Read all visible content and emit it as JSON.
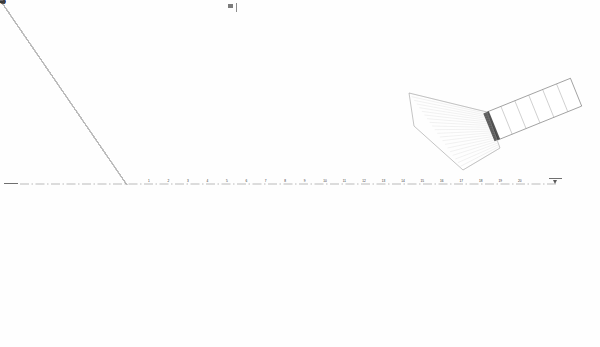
{
  "drawing": {
    "type": "architectural-floor-plan",
    "subject": "pointed-oval auditorium / arena seating plan",
    "background_color": "#ffffff",
    "ink_color": "#2b2b2b",
    "faint_ink_color": "#b9b9b9",
    "column_color": "#1d1d1d",
    "annotation_color": "#4a4a4a",
    "canvas": {
      "width": 600,
      "height": 347
    }
  },
  "markers": {
    "top_marker_label": "",
    "left_axis_marker_label": "",
    "right_axis_marker_label": ""
  },
  "geometry": {
    "focal_point": {
      "x": 127,
      "y": 185
    },
    "apex_point": {
      "x": 528,
      "y": 183
    },
    "outer_shell": {
      "left_arc_center_x": 150,
      "left_arc_center_y": 185,
      "left_arc_radius_x": 103,
      "left_arc_radius_y": 118
    },
    "ring_offsets": [
      0,
      3.2,
      6.0
    ],
    "radial_wedge_count": 30,
    "seating_tier_count": 26,
    "column_count_upper": 19,
    "column_count_lower": 19
  },
  "annotations": {
    "outer_radial_labels_top": [
      "12.5",
      "13.0",
      "13.4",
      "13.8",
      "14.1",
      "14.3",
      "14.5",
      "14.6",
      "14.6",
      "14.5",
      "14.3",
      "14.0",
      "13.6",
      "13.1",
      "12.5",
      "11.8"
    ],
    "outer_radial_labels_bottom": [
      "12.5",
      "13.0",
      "13.4",
      "13.8",
      "14.1",
      "14.3",
      "14.5",
      "14.6",
      "14.6",
      "14.5",
      "14.3",
      "14.0",
      "13.6",
      "13.1",
      "12.5",
      "11.8"
    ],
    "inner_dimension_ticks_top": [
      "60",
      "60",
      "60",
      "60",
      "60",
      "60",
      "60",
      "60",
      "60",
      "60",
      "60",
      "60",
      "60",
      "60",
      "60",
      "60",
      "60",
      "60"
    ],
    "inner_dimension_ticks_bottom": [
      "60",
      "60",
      "60",
      "60",
      "60",
      "60",
      "60",
      "60",
      "60",
      "60",
      "60",
      "60",
      "60",
      "60",
      "60",
      "60",
      "60",
      "60"
    ],
    "centerline_ticks": [
      "1",
      "2",
      "3",
      "4",
      "5",
      "6",
      "7",
      "8",
      "9",
      "10",
      "11",
      "12",
      "13",
      "14",
      "15",
      "16",
      "17",
      "18",
      "19",
      "20"
    ]
  },
  "ramp": {
    "label": "",
    "bay_count": 6,
    "origin": {
      "x": 487,
      "y": 112
    },
    "angle_deg": -22
  }
}
